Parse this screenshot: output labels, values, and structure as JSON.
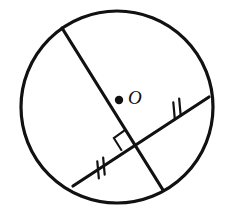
{
  "figure": {
    "kind": "circle-geometry-diagram",
    "width": 228,
    "height": 221,
    "background_color": "#ffffff",
    "stroke_color": "#111111"
  },
  "circle": {
    "name": "circle-O",
    "center_x": 117,
    "center_y": 107,
    "radius": 96,
    "stroke_width": 3.2
  },
  "center_point": {
    "label": "O",
    "dot_x": 119,
    "dot_y": 100,
    "dot_radius": 4.2,
    "label_x": 128,
    "label_y": 100
  },
  "chords": [
    {
      "name": "chord-upper-left-to-lower-right",
      "x1": 62,
      "y1": 28,
      "x2": 163,
      "y2": 190,
      "stroke_width": 3.2,
      "tick_marks": 0
    },
    {
      "name": "chord-lower-left-to-right",
      "x1": 73,
      "y1": 186,
      "x2": 209,
      "y2": 97,
      "stroke_width": 3.2,
      "tick_marks": 2
    }
  ],
  "intersection": {
    "name": "chord-intersection",
    "x": 134,
    "y": 142,
    "right_angle": true,
    "right_angle_size": 15
  },
  "tick_groups": [
    {
      "name": "tick-marks-right-segment",
      "center_x": 177,
      "center_y": 109,
      "count": 2,
      "length": 17,
      "spacing": 7
    },
    {
      "name": "tick-marks-left-segment",
      "center_x": 101,
      "center_y": 168,
      "count": 2,
      "length": 17,
      "spacing": 7
    }
  ]
}
